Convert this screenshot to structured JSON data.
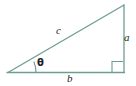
{
  "figure": {
    "kind": "right-triangle-diagram",
    "background_color": "#ffffff",
    "stroke_color": "#6b9e93",
    "label_color": "#231f20",
    "labels": {
      "hypotenuse": "c",
      "opposite_leg": "a",
      "adjacent_leg": "b",
      "angle": "θ"
    },
    "icons": {
      "right_angle_marker": "right-angle-marker"
    }
  }
}
